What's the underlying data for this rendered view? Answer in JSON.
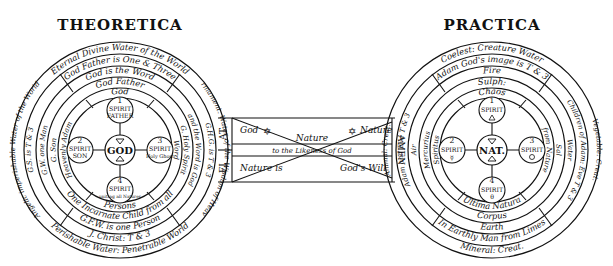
{
  "titles": {
    "left": "THEORETICA",
    "right": "PRACTICA"
  },
  "theoretica": {
    "rings": [
      {
        "label": "Eternal Divine Water of the World",
        "index": "1"
      },
      {
        "label": "God Father is One & Three",
        "index": "2"
      },
      {
        "label": "God is the Word",
        "index": "3"
      },
      {
        "label": "God Father",
        "index": "4"
      },
      {
        "label": "God",
        "index": "5"
      }
    ],
    "ring_texts": {
      "outer_left": "Angelic imperishable Water of the World",
      "outer_right": "Firmament. Water of the Wisdom of Heaven",
      "outer_bottom": "Perishable Water: Penetrable World",
      "second_left": "G.S. is T & 3",
      "second_right": "G.H.G. is T & 3",
      "second_bottom": "J. Christ: T & 3",
      "third_left": "G.W. one Man",
      "third_right": "and the Word is God",
      "third_bottom": "G.F.W. is one Person",
      "fourth_left": "G. Son",
      "fourth_right": "G. Holy Spirit",
      "fourth_bottom": "One Incarnate Child from all",
      "fifth_left": "Heavenly Adam",
      "fifth_right": "Word",
      "fifth_bottom": "Persons"
    },
    "center": "GOD",
    "spirits": [
      {
        "num": "1",
        "label": "SPIRIT",
        "sub": "FATHER"
      },
      {
        "num": "2",
        "label": "SPIRIT",
        "sub": "SON"
      },
      {
        "num": "3",
        "label": "SPIRIT",
        "sub": "Holy Ghost"
      },
      {
        "num": "4",
        "label": "SPIRIT",
        "sub": "uniting all Natures"
      }
    ]
  },
  "practica": {
    "rings": [
      {
        "label": "Coelest: Creature Water",
        "index": "1"
      },
      {
        "label": "Adam God's image is T & 3",
        "index": "2"
      },
      {
        "label": "Fire",
        "index": "3"
      },
      {
        "label": "Sulph:",
        "index": "4"
      },
      {
        "label": "Chaos",
        "index": "5"
      }
    ],
    "ring_texts": {
      "outer_left": "Animal: Creat.",
      "outer_right": "Vegetable: Creat.",
      "outer_bottom": "Mineral: Creat.",
      "second_left": "Adam and Eve T & 3",
      "second_right": "Children of Adam: Eve T & 3",
      "second_bottom": "In Earthly Man from Limes",
      "third_left": "Air",
      "third_right": "Water",
      "third_bottom": "Earth",
      "fourth_left": "Mercurius",
      "fourth_right": "Sal",
      "fourth_bottom": "Corpus",
      "fifth_left": "Spiritus",
      "fifth_right": "from Nature",
      "fifth_bottom": "Ultima Natura"
    },
    "center": "NAT.",
    "spirits": [
      {
        "num": "1",
        "label": "SPIRIT",
        "sub": ""
      },
      {
        "num": "2",
        "label": "SPIRIT",
        "sub": ""
      },
      {
        "num": "3",
        "label": "SPIRIT",
        "sub": ""
      },
      {
        "num": "4",
        "label": "SPIRIT",
        "sub": ""
      }
    ]
  },
  "bridge": {
    "left_caps": [
      "AT",
      "FI"
    ],
    "right_caps": [
      "AMEN"
    ],
    "top_left": "God",
    "top_right": "Nature",
    "middle": "Nature",
    "middle_sub": "to the Likeness of God",
    "bottom_left": "Nature is",
    "bottom_right": "God's Will",
    "star_glyph": "✡"
  }
}
